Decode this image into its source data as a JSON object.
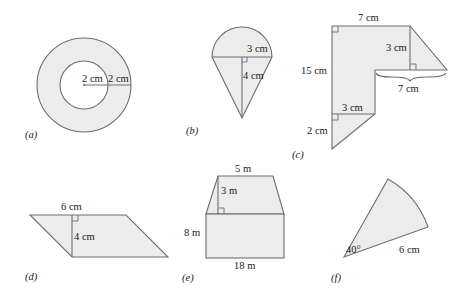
{
  "figures": {
    "a": {
      "caption": "(a)",
      "type": "annulus",
      "inner_radius_label": "2 cm",
      "ring_width_label": "2 cm"
    },
    "b": {
      "caption": "(b)",
      "type": "semicircle-on-triangle",
      "radius_label": "3 cm",
      "height_label": "4 cm"
    },
    "c": {
      "caption": "(c)",
      "type": "composite-polygon",
      "top_label": "7 cm",
      "left_label": "15 cm",
      "right_triangle_height_label": "3 cm",
      "brace_label": "7 cm",
      "bottom_rect_width_label": "3 cm",
      "bottom_triangle_label": "2 cm"
    },
    "d": {
      "caption": "(d)",
      "type": "parallelogram",
      "base_label": "6 cm",
      "height_label": "4 cm"
    },
    "e": {
      "caption": "(e)",
      "type": "trapezoid-on-rectangle",
      "top_label": "5 m",
      "trapezoid_height_label": "3 m",
      "rect_height_label": "8 m",
      "base_label": "18 m"
    },
    "f": {
      "caption": "(f)",
      "type": "sector",
      "angle_label": "40°",
      "radius_label": "6 cm"
    }
  },
  "colors": {
    "fill": "#ececec",
    "stroke": "#6e6e6e",
    "text": "#1a1a1a"
  }
}
